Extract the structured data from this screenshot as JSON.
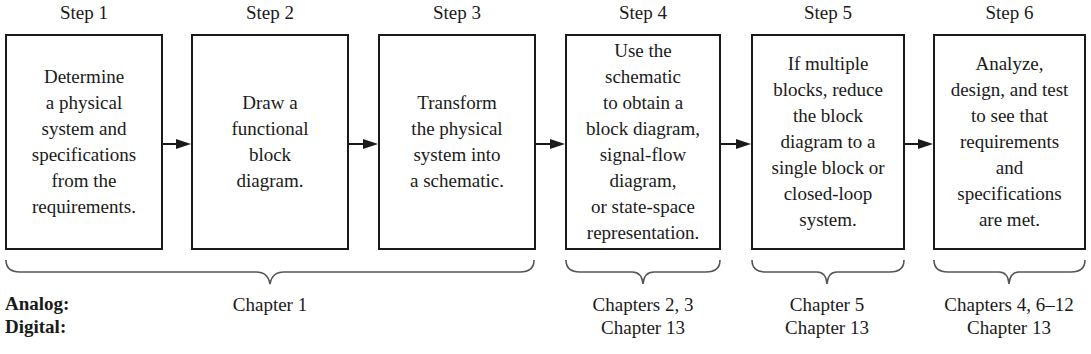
{
  "steps": [
    {
      "label": "Step 1",
      "text": "Determine\na physical\nsystem and\nspecifications\nfrom the\nrequirements."
    },
    {
      "label": "Step 2",
      "text": "Draw a\nfunctional\nblock\ndiagram."
    },
    {
      "label": "Step 3",
      "text": "Transform\nthe physical\nsystem into\na schematic."
    },
    {
      "label": "Step 4",
      "text": "Use the\nschematic\nto obtain a\nblock diagram,\nsignal-flow\ndiagram,\nor state-space\nrepresentation."
    },
    {
      "label": "Step 5",
      "text": "If multiple\nblocks, reduce\nthe block\ndiagram to a\nsingle block or\nclosed-loop\nsystem."
    },
    {
      "label": "Step 6",
      "text": "Analyze,\ndesign, and test\nto see that\nrequirements\nand\nspecifications\nare met."
    }
  ],
  "rows": {
    "analog_label": "Analog:",
    "digital_label": "Digital:"
  },
  "groups": [
    {
      "analog": "Chapter 1",
      "digital": ""
    },
    {
      "analog": "Chapters 2, 3",
      "digital": "Chapter 13"
    },
    {
      "analog": "Chapter 5",
      "digital": "Chapter 13"
    },
    {
      "analog": "Chapters 4, 6–12",
      "digital": "Chapter 13"
    }
  ]
}
